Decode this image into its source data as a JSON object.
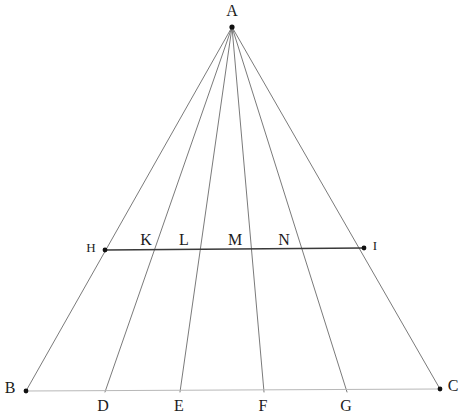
{
  "figure": {
    "width": 465,
    "height": 419,
    "background_color": "#ffffff"
  },
  "style": {
    "cevian_color": "#6b6b6b",
    "cevian_width": 0.9,
    "baseline_color": "#b8b8b8",
    "baseline_width": 1.0,
    "transversal_color": "#3a3a3a",
    "transversal_width": 1.6,
    "dot_color": "#111111",
    "label_color": "#1c1c1c"
  },
  "points": [
    {
      "name": "A",
      "label": "A",
      "x": 232,
      "y": 27,
      "label_x": 232,
      "label_y": 11,
      "dot": true,
      "dot_r": 2.6,
      "size": "normal"
    },
    {
      "name": "B",
      "label": "B",
      "x": 26,
      "y": 391,
      "label_x": 10,
      "label_y": 388,
      "dot": true,
      "dot_r": 2.4,
      "size": "normal"
    },
    {
      "name": "C",
      "label": "C",
      "x": 440,
      "y": 389,
      "label_x": 453,
      "label_y": 386,
      "dot": true,
      "dot_r": 2.4,
      "size": "normal"
    },
    {
      "name": "D",
      "label": "D",
      "x": 105,
      "y": 392,
      "label_x": 103,
      "label_y": 406,
      "dot": false,
      "dot_r": 0,
      "size": "normal"
    },
    {
      "name": "E",
      "label": "E",
      "x": 180,
      "y": 392,
      "label_x": 179,
      "label_y": 406,
      "dot": false,
      "dot_r": 0,
      "size": "normal"
    },
    {
      "name": "F",
      "label": "F",
      "x": 264,
      "y": 392,
      "label_x": 263,
      "label_y": 406,
      "dot": false,
      "dot_r": 0,
      "size": "normal"
    },
    {
      "name": "G",
      "label": "G",
      "x": 347,
      "y": 392,
      "label_x": 346,
      "label_y": 406,
      "dot": false,
      "dot_r": 0,
      "size": "normal"
    },
    {
      "name": "H",
      "label": "H",
      "x": 105,
      "y": 250,
      "label_x": 91,
      "label_y": 247,
      "dot": true,
      "dot_r": 2.4,
      "size": "small"
    },
    {
      "name": "I",
      "label": "I",
      "x": 364,
      "y": 248,
      "label_x": 375,
      "label_y": 245,
      "dot": true,
      "dot_r": 2.4,
      "size": "small"
    },
    {
      "name": "K",
      "label": "K",
      "x": 148,
      "y": 249,
      "label_x": 146,
      "label_y": 240,
      "dot": false,
      "dot_r": 0,
      "size": "normal"
    },
    {
      "name": "L",
      "label": "L",
      "x": 198,
      "y": 249,
      "label_x": 184,
      "label_y": 240,
      "dot": false,
      "dot_r": 0,
      "size": "normal"
    },
    {
      "name": "M",
      "label": "M",
      "x": 252,
      "y": 249,
      "label_x": 235,
      "label_y": 240,
      "dot": false,
      "dot_r": 0,
      "size": "normal"
    },
    {
      "name": "N",
      "label": "N",
      "x": 303,
      "y": 249,
      "label_x": 284,
      "label_y": 240,
      "dot": false,
      "dot_r": 0,
      "size": "normal"
    }
  ],
  "segments": [
    {
      "name": "side-AB",
      "from": "A",
      "to": "B",
      "kind": "cevian"
    },
    {
      "name": "cevian-AD",
      "from": "A",
      "to": "D",
      "kind": "cevian"
    },
    {
      "name": "cevian-AE",
      "from": "A",
      "to": "E",
      "kind": "cevian"
    },
    {
      "name": "cevian-AF",
      "from": "A",
      "to": "F",
      "kind": "cevian"
    },
    {
      "name": "cevian-AG",
      "from": "A",
      "to": "G",
      "kind": "cevian"
    },
    {
      "name": "side-AC",
      "from": "A",
      "to": "C",
      "kind": "cevian"
    },
    {
      "name": "baseline-BC",
      "from": "B",
      "to": "C",
      "kind": "baseline"
    },
    {
      "name": "transversal-HI",
      "from": "H",
      "to": "I",
      "kind": "transversal"
    }
  ]
}
